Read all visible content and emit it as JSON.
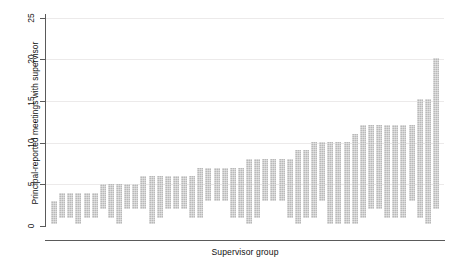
{
  "figure": {
    "clipped_top_text": "",
    "background_color": "#ffffff",
    "bar_color": "#b9b9b9",
    "axis_color": "#5a5a5a",
    "grid_color": "#eceaea"
  },
  "axes": {
    "ylabel": "Principal-reported meetings with supervisor",
    "xlabel": "Supervisor group",
    "yticks": [
      0,
      5,
      10,
      15,
      20,
      25
    ],
    "ytick_labels": [
      "0",
      "5",
      "10",
      "15",
      "20",
      "25"
    ],
    "ylim": [
      0,
      25
    ],
    "xticks": [],
    "xtick_labels": []
  },
  "chart_data": {
    "type": "bar",
    "subtype": "floating-range-bar",
    "title": "",
    "xlabel": "Supervisor group",
    "ylabel": "Principal-reported meetings with supervisor",
    "ylim": [
      0,
      25
    ],
    "grid": "horizontal",
    "legend": "none",
    "orientation": "vertical",
    "note": "Each bar spans the minimum to maximum principal-reported number of meetings within a supervisor group; groups sorted ascending by maximum.",
    "categories": [
      "g1",
      "g2",
      "g3",
      "g4",
      "g5",
      "g6",
      "g7",
      "g8",
      "g9",
      "g10",
      "g11",
      "g12",
      "g13",
      "g14",
      "g15",
      "g16",
      "g17",
      "g18",
      "g19",
      "g20",
      "g21",
      "g22",
      "g23",
      "g24",
      "g25",
      "g26",
      "g27",
      "g28",
      "g29",
      "g30",
      "g31",
      "g32",
      "g33",
      "g34",
      "g35",
      "g36",
      "g37",
      "g38",
      "g39",
      "g40",
      "g41",
      "g42",
      "g43",
      "g44",
      "g45",
      "g46",
      "g47",
      "g48"
    ],
    "series": [
      {
        "name": "range-low",
        "values": [
          0.2,
          1.0,
          1.0,
          0.2,
          1.0,
          1.0,
          2.0,
          1.0,
          0.2,
          2.0,
          2.0,
          2.0,
          0.2,
          1.0,
          2.0,
          2.0,
          2.0,
          1.0,
          1.0,
          3.0,
          3.0,
          3.0,
          1.0,
          1.0,
          0.2,
          1.0,
          3.0,
          3.0,
          3.0,
          1.0,
          0.2,
          1.0,
          1.0,
          3.0,
          0.2,
          0.2,
          0.2,
          0.2,
          1.0,
          2.0,
          2.0,
          1.0,
          1.0,
          1.0,
          3.0,
          1.0,
          0.2,
          2.0
        ]
      },
      {
        "name": "range-high",
        "values": [
          3.0,
          4.0,
          4.0,
          4.0,
          4.0,
          4.0,
          5.0,
          5.0,
          5.0,
          5.0,
          5.0,
          6.0,
          6.0,
          6.0,
          6.0,
          6.0,
          6.0,
          6.0,
          7.0,
          7.0,
          7.0,
          7.0,
          7.0,
          7.0,
          8.1,
          8.1,
          8.1,
          8.1,
          8.1,
          8.1,
          9.1,
          9.1,
          10.1,
          10.1,
          10.1,
          10.1,
          10.1,
          11.1,
          12.1,
          12.1,
          12.1,
          12.1,
          12.1,
          12.1,
          12.1,
          15.2,
          15.2,
          20.2
        ]
      }
    ]
  }
}
